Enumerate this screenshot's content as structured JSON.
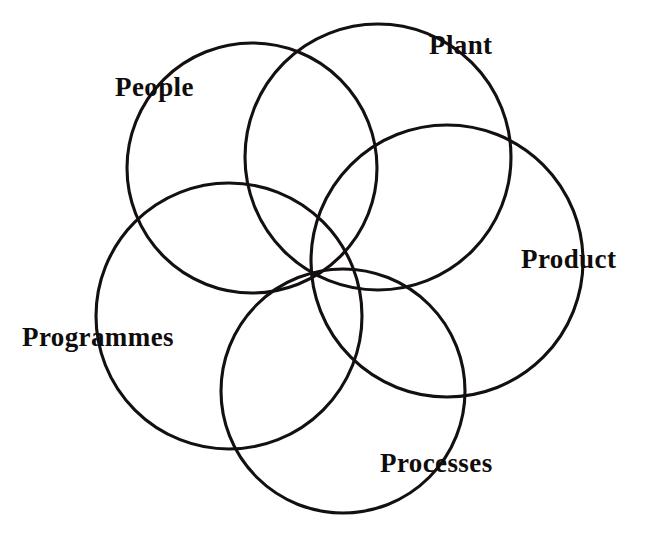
{
  "diagram": {
    "type": "venn",
    "title": "",
    "background_color": "#ffffff",
    "stroke_color": "#14100f",
    "stroke_width": 3.1,
    "canvas": {
      "width": 648,
      "height": 536
    },
    "sets": [
      {
        "id": "people",
        "label": "People",
        "circle": {
          "cx": 252,
          "cy": 168,
          "r": 125
        },
        "label_position": {
          "x": 115,
          "y": 74
        }
      },
      {
        "id": "plant",
        "label": "Plant",
        "circle": {
          "cx": 378,
          "cy": 157,
          "r": 133
        },
        "label_position": {
          "x": 429,
          "y": 32
        }
      },
      {
        "id": "product",
        "label": "Product",
        "circle": {
          "cx": 447,
          "cy": 261,
          "r": 136
        },
        "label_position": {
          "x": 521,
          "y": 246
        }
      },
      {
        "id": "programmes",
        "label": "Programmes",
        "circle": {
          "cx": 229,
          "cy": 316,
          "r": 133
        },
        "label_position": {
          "x": 22,
          "y": 324
        }
      },
      {
        "id": "processes",
        "label": "Processes",
        "circle": {
          "cx": 343,
          "cy": 391,
          "r": 122
        },
        "label_position": {
          "x": 380,
          "y": 450
        }
      }
    ]
  },
  "chart_data": {
    "type": "diagram",
    "subtype": "venn",
    "title": "",
    "categories": [
      "People",
      "Plant",
      "Product",
      "Programmes",
      "Processes"
    ],
    "legend": [],
    "annotations": [
      "People",
      "Plant",
      "Product",
      "Programmes",
      "Processes"
    ],
    "grid": false
  }
}
